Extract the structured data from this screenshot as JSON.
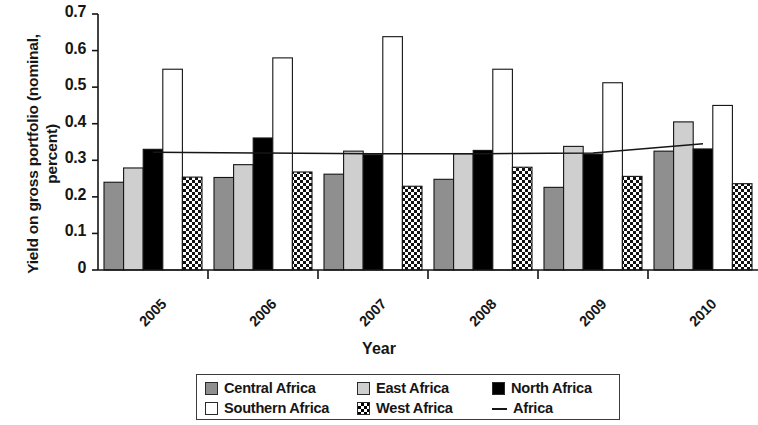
{
  "chart_data": {
    "type": "bar",
    "title": "",
    "xlabel": "Year",
    "ylabel": "Yield on gross portfolio (nominal, percent)",
    "categories": [
      "2005",
      "2006",
      "2007",
      "2008",
      "2009",
      "2010"
    ],
    "ylim": [
      0,
      0.7
    ],
    "ytick_labels": [
      "0.7",
      "0.6",
      "0.5",
      "0.4",
      "0.3",
      "0.2",
      "0.1",
      "0"
    ],
    "ytick_values": [
      0.7,
      0.6,
      0.5,
      0.4,
      0.3,
      0.2,
      0.1,
      0
    ],
    "grid": false,
    "legend_position": "bottom",
    "series": [
      {
        "name": "Central Africa",
        "type": "bar",
        "fill": "gray-medium",
        "color": "#8f8f8f",
        "values": [
          0.24,
          0.253,
          0.262,
          0.248,
          0.226,
          0.325
        ]
      },
      {
        "name": "East Africa",
        "type": "bar",
        "fill": "gray-light",
        "color": "#cfcfcf",
        "values": [
          0.279,
          0.288,
          0.325,
          0.318,
          0.338,
          0.405
        ]
      },
      {
        "name": "North Africa",
        "type": "bar",
        "fill": "black",
        "color": "#000000",
        "values": [
          0.33,
          0.361,
          0.315,
          0.327,
          0.317,
          0.331
        ]
      },
      {
        "name": "Southern Africa",
        "type": "bar",
        "fill": "white",
        "color": "#ffffff",
        "values": [
          0.549,
          0.58,
          0.638,
          0.549,
          0.512,
          0.45
        ]
      },
      {
        "name": "West Africa",
        "type": "bar",
        "fill": "checkerboard",
        "color": "#ffffff",
        "values": [
          0.254,
          0.268,
          0.229,
          0.281,
          0.256,
          0.236
        ]
      },
      {
        "name": "Africa",
        "type": "line",
        "fill": "none",
        "color": "#161616",
        "values": [
          0.322,
          0.32,
          0.318,
          0.318,
          0.32,
          0.345
        ]
      }
    ]
  },
  "legend": {
    "entries": [
      {
        "label": "Central Africa",
        "swatch": "gray-medium-square-icon"
      },
      {
        "label": "East Africa",
        "swatch": "gray-light-square-icon"
      },
      {
        "label": "North Africa",
        "swatch": "black-square-icon"
      },
      {
        "label": "Southern Africa",
        "swatch": "white-square-icon"
      },
      {
        "label": "West Africa",
        "swatch": "checkerboard-square-icon"
      },
      {
        "label": "Africa",
        "swatch": "line-dash-icon"
      }
    ]
  }
}
